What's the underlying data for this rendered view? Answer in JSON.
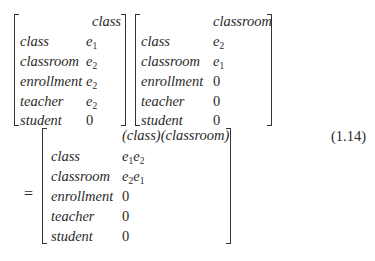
{
  "equation_number": "(1.14)",
  "equals": "=",
  "row_labels": [
    "class",
    "classroom",
    "enrollment",
    "teacher",
    "student"
  ],
  "matrix_a": {
    "header": "class",
    "values": [
      {
        "base": "e",
        "sub": "1"
      },
      {
        "base": "e",
        "sub": "2"
      },
      {
        "base": "e",
        "sub": "2"
      },
      {
        "base": "e",
        "sub": "2"
      },
      {
        "zero": "0"
      }
    ]
  },
  "matrix_b": {
    "header": "classroom",
    "values": [
      {
        "base": "e",
        "sub": "2"
      },
      {
        "base": "e",
        "sub": "1"
      },
      {
        "zero": "0"
      },
      {
        "zero": "0"
      },
      {
        "zero": "0"
      }
    ]
  },
  "matrix_result": {
    "header": "(class)(classroom)",
    "values": [
      {
        "terms": [
          {
            "base": "e",
            "sub": "1"
          },
          {
            "base": "e",
            "sub": "2"
          }
        ]
      },
      {
        "terms": [
          {
            "base": "e",
            "sub": "2"
          },
          {
            "base": "e",
            "sub": "1"
          }
        ]
      },
      {
        "zero": "0"
      },
      {
        "zero": "0"
      },
      {
        "zero": "0"
      }
    ]
  }
}
